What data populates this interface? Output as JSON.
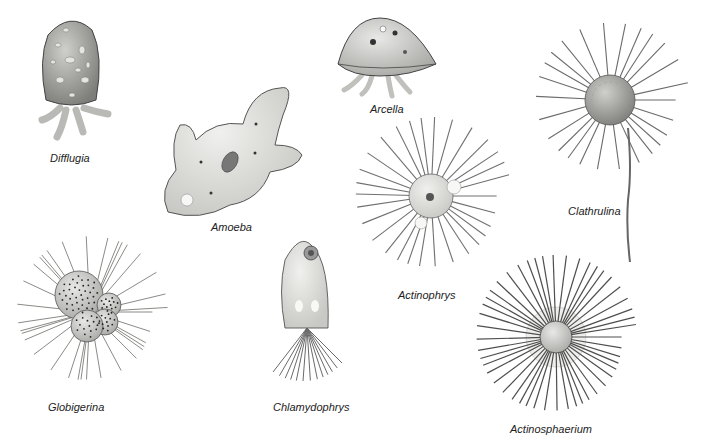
{
  "plate": {
    "background": "#ffffff",
    "organisms": [
      {
        "id": "difflugia",
        "label": "Difflugia",
        "label_pos": [
          50,
          152
        ]
      },
      {
        "id": "amoeba",
        "label": "Amoeba",
        "label_pos": [
          211,
          221
        ]
      },
      {
        "id": "arcella",
        "label": "Arcella",
        "label_pos": [
          370,
          103
        ]
      },
      {
        "id": "clathrulina",
        "label": "Clathrulina",
        "label_pos": [
          568,
          205
        ]
      },
      {
        "id": "actinophrys",
        "label": "Actinophrys",
        "label_pos": [
          398,
          289
        ]
      },
      {
        "id": "globigerina",
        "label": "Globigerina",
        "label_pos": [
          48,
          401
        ]
      },
      {
        "id": "chlamydophrys",
        "label": "Chlamydophrys",
        "label_pos": [
          273,
          401
        ]
      },
      {
        "id": "actinosphaerium",
        "label": "Actinosphaerium",
        "label_pos": [
          510,
          423
        ]
      }
    ]
  }
}
